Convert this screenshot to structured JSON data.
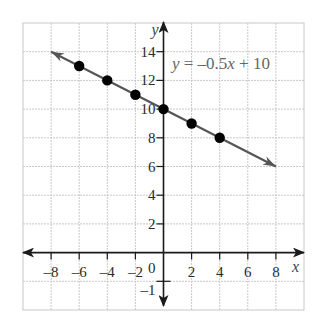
{
  "chart_data": {
    "type": "line",
    "title": "",
    "xlabel": "x",
    "ylabel": "y",
    "xlim": [
      -10,
      10
    ],
    "ylim": [
      -4,
      16
    ],
    "grid": true,
    "grid_step": 2,
    "x_ticks": [
      -8,
      -6,
      -4,
      -2,
      2,
      4,
      6,
      8
    ],
    "x_tick_labels": [
      "–8",
      "–6",
      "–4",
      "–2",
      "2",
      "4",
      "6",
      "8"
    ],
    "y_ticks": [
      2,
      4,
      6,
      8,
      10,
      12,
      14
    ],
    "y_tick_labels": [
      "2",
      "4",
      "6",
      "8",
      "10",
      "12",
      "14"
    ],
    "origin_label": "0",
    "extra_y_tick": {
      "value": -2,
      "label": "–1"
    },
    "series": [
      {
        "name": "y = –0.5x + 10",
        "equation": "y = -0.5x + 10",
        "slope": -0.5,
        "intercept": 10,
        "line_from": [
          -8,
          14
        ],
        "line_to": [
          8,
          6
        ],
        "arrows": "both",
        "color": "#555555",
        "points": [
          {
            "x": -6,
            "y": 13
          },
          {
            "x": -4,
            "y": 12
          },
          {
            "x": -2,
            "y": 11
          },
          {
            "x": 0,
            "y": 10
          },
          {
            "x": 2,
            "y": 9
          },
          {
            "x": 4,
            "y": 8
          }
        ]
      }
    ],
    "annotations": [
      {
        "text": "y = –0.5x + 10",
        "x": 0.6,
        "y": 12.8,
        "color": "#666666"
      }
    ]
  },
  "labels": {
    "x_axis": "x",
    "y_axis": "y",
    "equation_parts": [
      "y",
      " = –0.5",
      "x",
      " + 10"
    ]
  }
}
